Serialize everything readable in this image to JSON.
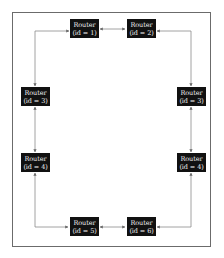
{
  "diagram": {
    "type": "ring-topology",
    "nodes": [
      {
        "key": "n1",
        "line1": "Router",
        "line2": "(id = 1)"
      },
      {
        "key": "n2",
        "line1": "Router",
        "line2": "(id = 2)"
      },
      {
        "key": "n3l",
        "line1": "Router",
        "line2": "(id = 3)"
      },
      {
        "key": "n3r",
        "line1": "Router",
        "line2": "(id = 3)"
      },
      {
        "key": "n4l",
        "line1": "Router",
        "line2": "(id = 4)"
      },
      {
        "key": "n4r",
        "line1": "Router",
        "line2": "(id = 4)"
      },
      {
        "key": "n5",
        "line1": "Router",
        "line2": "(id = 5)"
      },
      {
        "key": "n6",
        "line1": "Router",
        "line2": "(id = 6)"
      }
    ],
    "edges": [
      {
        "from": "n1",
        "to": "n2",
        "direction": "bidirectional"
      },
      {
        "from": "n1",
        "to": "n3l",
        "direction": "bidirectional"
      },
      {
        "from": "n2",
        "to": "n3r",
        "direction": "bidirectional"
      },
      {
        "from": "n3l",
        "to": "n4l",
        "direction": "bidirectional"
      },
      {
        "from": "n3r",
        "to": "n4r",
        "direction": "bidirectional"
      },
      {
        "from": "n4l",
        "to": "n5",
        "direction": "bidirectional"
      },
      {
        "from": "n4r",
        "to": "n6",
        "direction": "bidirectional"
      },
      {
        "from": "n5",
        "to": "n6",
        "direction": "bidirectional"
      }
    ],
    "colors": {
      "node_fill": "#111111",
      "node_text": "#f2f2f2",
      "edge": "#888888",
      "frame": "#6b6b6b"
    }
  }
}
